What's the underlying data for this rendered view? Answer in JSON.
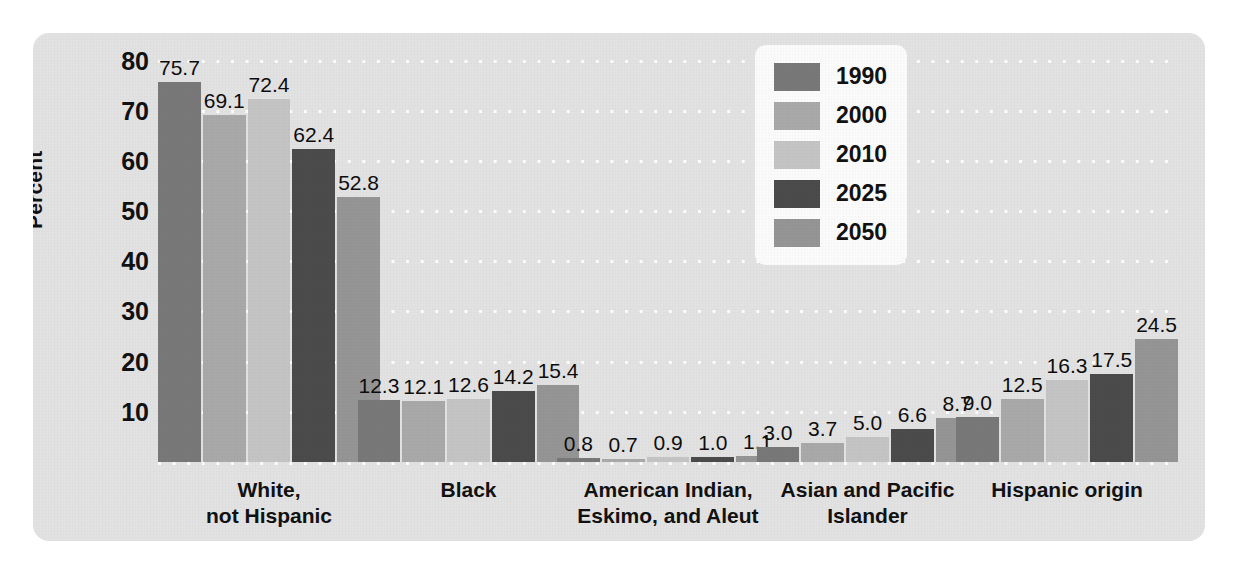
{
  "chart_data": {
    "type": "bar",
    "title": "",
    "xlabel": "",
    "ylabel": "Percent",
    "ylim": [
      0,
      80
    ],
    "yticks": [
      80,
      70,
      60,
      50,
      40,
      30,
      20,
      10
    ],
    "grid": true,
    "legend_position": "top-center-right",
    "categories": [
      "White,\nnot Hispanic",
      "Black",
      "American Indian,\nEskimo, and Aleut",
      "Asian and Pacific\nIslander",
      "Hispanic origin"
    ],
    "category_lines": [
      [
        "White,",
        "not Hispanic"
      ],
      [
        "Black"
      ],
      [
        "American Indian,",
        "Eskimo, and Aleut"
      ],
      [
        "Asian and Pacific",
        "Islander"
      ],
      [
        "Hispanic origin"
      ]
    ],
    "series": [
      {
        "name": "1990",
        "color": "#787878",
        "values": [
          75.7,
          12.3,
          0.8,
          3.0,
          9.0
        ],
        "labels": [
          "75.7",
          "12.3",
          "0.8",
          "3.0",
          "9.0"
        ]
      },
      {
        "name": "2000",
        "color": "#a9a9a9",
        "values": [
          69.1,
          12.1,
          0.7,
          3.7,
          12.5
        ],
        "labels": [
          "69.1",
          "12.1",
          "0.7",
          "3.7",
          "12.5"
        ]
      },
      {
        "name": "2010",
        "color": "#c4c4c4",
        "values": [
          72.4,
          12.6,
          0.9,
          5.0,
          16.3
        ],
        "labels": [
          "72.4",
          "12.6",
          "0.9",
          "5.0",
          "16.3"
        ]
      },
      {
        "name": "2025",
        "color": "#4b4b4b",
        "values": [
          62.4,
          14.2,
          1.0,
          6.6,
          17.5
        ],
        "labels": [
          "62.4",
          "14.2",
          "1.0",
          "6.6",
          "17.5"
        ]
      },
      {
        "name": "2050",
        "color": "#959595",
        "values": [
          52.8,
          15.4,
          1.1,
          8.7,
          24.5
        ],
        "labels": [
          "52.8",
          "15.4",
          "1.1",
          "8.7",
          "24.5"
        ]
      }
    ]
  },
  "legend": {
    "items": [
      {
        "label": "1990",
        "color": "#787878"
      },
      {
        "label": "2000",
        "color": "#a9a9a9"
      },
      {
        "label": "2010",
        "color": "#c4c4c4"
      },
      {
        "label": "2025",
        "color": "#4b4b4b"
      },
      {
        "label": "2050",
        "color": "#959595"
      }
    ]
  },
  "colors": {
    "panel_background": "#e2e2e2",
    "legend_background": "#fbfbfb",
    "gridline": "#ffffff",
    "text": "#111111"
  }
}
